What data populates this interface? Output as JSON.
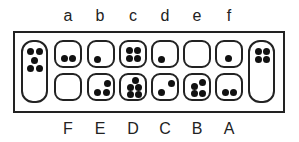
{
  "top_labels": [
    "a",
    "b",
    "c",
    "d",
    "e",
    "f"
  ],
  "bottom_labels": [
    "F",
    "E",
    "D",
    "C",
    "B",
    "A"
  ],
  "left_store": {
    "name": "left-store",
    "stones": 5
  },
  "right_store": {
    "name": "right-store",
    "stones": 4
  },
  "top_row": [
    {
      "label": "a",
      "stones": 2
    },
    {
      "label": "b",
      "stones": 1
    },
    {
      "label": "c",
      "stones": 4
    },
    {
      "label": "d",
      "stones": 1
    },
    {
      "label": "e",
      "stones": 0
    },
    {
      "label": "f",
      "stones": 1
    }
  ],
  "bottom_row": [
    {
      "label": "F",
      "stones": 0
    },
    {
      "label": "E",
      "stones": 3
    },
    {
      "label": "D",
      "stones": 5
    },
    {
      "label": "C",
      "stones": 2
    },
    {
      "label": "B",
      "stones": 4
    },
    {
      "label": "A",
      "stones": 2
    }
  ]
}
